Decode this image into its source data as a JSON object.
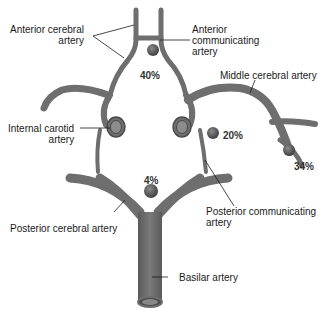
{
  "diagram": {
    "labels": {
      "anterior_cerebral": [
        "Anterior cerebral",
        "artery"
      ],
      "anterior_communicating": [
        "Anterior",
        "communicating",
        "artery"
      ],
      "middle_cerebral": "Middle cerebral artery",
      "internal_carotid": [
        "Internal carotid",
        "artery"
      ],
      "posterior_cerebral": "Posterior cerebral artery",
      "posterior_communicating": [
        "Posterior communicating",
        "artery"
      ],
      "basilar": "Basilar artery"
    },
    "percentages": {
      "anterior_communicating": "40%",
      "internal_carotid_pcom": "20%",
      "middle_cerebral": "34%",
      "basilar_tip": "4%"
    },
    "colors": {
      "vessel": "#6e6e6e",
      "vessel_dark": "#4a4a4a",
      "vessel_light": "#8c8c8c",
      "aneurysm": "#555555",
      "leader": "#1a1a1a"
    }
  }
}
